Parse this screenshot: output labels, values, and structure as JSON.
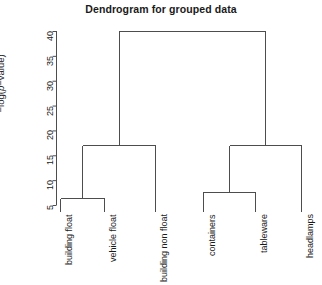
{
  "chart_data": {
    "type": "dendrogram",
    "title": "Dendrogram for grouped data",
    "xlabel": "",
    "ylabel": "−log(p−value)",
    "ylabel_parts": {
      "pre": "−log(",
      "italic": "p",
      "post": "−value)"
    },
    "ylim": [
      5,
      40
    ],
    "yticks": [
      5,
      10,
      15,
      20,
      25,
      30,
      35,
      40
    ],
    "ytick_labels": [
      "5",
      "10",
      "15",
      "20",
      "25",
      "30",
      "35",
      "40"
    ],
    "grid": false,
    "legend": "none",
    "leaves": [
      "building float",
      "vehicle float",
      "building non float",
      "containers",
      "tableware",
      "headlamps"
    ],
    "leaf_order": [
      0,
      1,
      2,
      3,
      4,
      5
    ],
    "merges": [
      {
        "id": "m1",
        "children": [
          "building float",
          "vehicle float"
        ],
        "height": 6.4
      },
      {
        "id": "m2",
        "children": [
          "m1",
          "building non float"
        ],
        "height": 17.0
      },
      {
        "id": "m3",
        "children": [
          "containers",
          "tableware"
        ],
        "height": 7.7
      },
      {
        "id": "m4",
        "children": [
          "m3",
          "headlamps"
        ],
        "height": 17.0
      },
      {
        "id": "root",
        "children": [
          "m2",
          "m4"
        ],
        "height": 40.0
      }
    ],
    "line_color": "#4d4d4d",
    "axis_color": "#4d4d4d",
    "background": "#ffffff"
  }
}
